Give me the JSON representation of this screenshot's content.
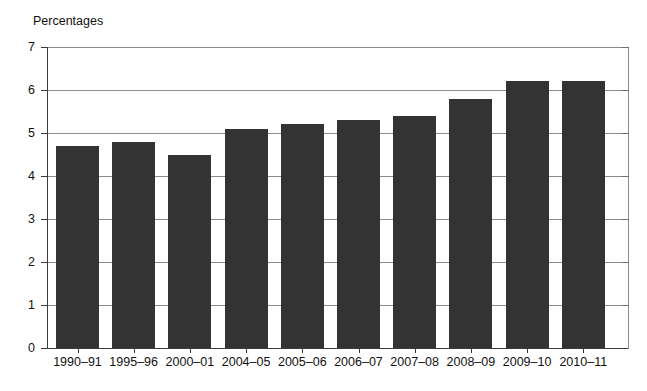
{
  "axis_title": "Percentages",
  "chart_data": {
    "type": "bar",
    "title": "",
    "subtitle": "",
    "xlabel": "",
    "ylabel": "Percentages",
    "ylim": [
      0,
      7
    ],
    "yticks": [
      0,
      1,
      2,
      3,
      4,
      5,
      6,
      7
    ],
    "ytick_labels": [
      "0",
      "1",
      "2",
      "3",
      "4",
      "5",
      "6",
      "7"
    ],
    "grid": true,
    "legend": null,
    "bar_color": "#333333",
    "gridline_color": "#8c8c8c",
    "axis_color": "#3a3a3a",
    "categories": [
      "1990–91",
      "1995–96",
      "2000–01",
      "2004–05",
      "2005–06",
      "2006–07",
      "2007–08",
      "2008–09",
      "2009–10",
      "2010–11"
    ],
    "values": [
      4.7,
      4.8,
      4.5,
      5.1,
      5.2,
      5.3,
      5.4,
      5.8,
      6.2,
      6.2
    ]
  }
}
